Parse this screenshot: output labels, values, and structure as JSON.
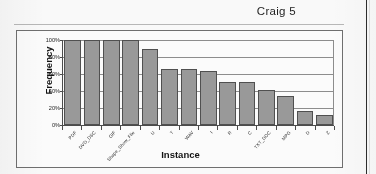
{
  "header": {
    "title": "Craig 5"
  },
  "chart_data": {
    "type": "bar",
    "title": "",
    "xlabel": "Instance",
    "ylabel": "Frequency",
    "ylim": [
      0,
      100
    ],
    "ytick_labels": [
      "100%",
      "80%",
      "60%",
      "40%",
      "20%",
      "0%"
    ],
    "ytick_values": [
      100,
      80,
      60,
      40,
      20,
      0
    ],
    "grid": true,
    "legend": false,
    "categories": [
      "PDF",
      "DVD_DSC",
      "GIF",
      "Shape_Show_File",
      "U",
      "T",
      "WAV",
      "I",
      "R",
      "C",
      "TXT_DOC",
      "MPG",
      "D",
      "Z"
    ],
    "values": [
      100,
      100,
      100,
      100,
      89,
      66,
      66,
      64,
      51,
      51,
      41,
      34,
      16,
      12
    ],
    "bar_color": "#9a9a9a",
    "bar_border_color": "#4f4f4f"
  }
}
